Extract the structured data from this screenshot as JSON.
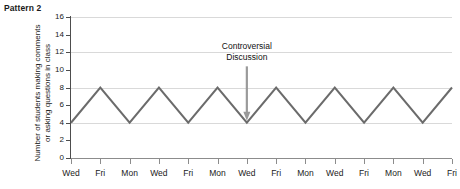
{
  "title": "Pattern 2",
  "chart_data": {
    "type": "line",
    "title": "Pattern 2",
    "xlabel": "",
    "ylabel": "Number of students making comments or asking questions in class",
    "ylabel_lines": [
      "Number of students making comments",
      "or asking questions in class"
    ],
    "categories": [
      "Wed",
      "Fri",
      "Mon",
      "Wed",
      "Fri",
      "Mon",
      "Wed",
      "Fri",
      "Mon",
      "Wed",
      "Fri",
      "Mon",
      "Wed",
      "Fri"
    ],
    "values": [
      4,
      8,
      4,
      8,
      4,
      8,
      4,
      8,
      4,
      8,
      4,
      8,
      4,
      8
    ],
    "ylim": [
      0,
      16
    ],
    "yticks": [
      0,
      2,
      4,
      6,
      8,
      10,
      12,
      14,
      16
    ],
    "ytick_labels": [
      "0",
      "2",
      "4",
      "6",
      "8",
      "10",
      "12",
      "14",
      "16"
    ],
    "gridlines_y": [
      4,
      8,
      12,
      16
    ],
    "grid": true,
    "legend": "none",
    "line_color": "#6b6b6b",
    "grid_color": "#d9d9d9",
    "axis_color": "#8c8c8c",
    "annotations": [
      {
        "text": "Controversial Discussion",
        "lines": [
          "Controversial",
          "Discussion"
        ],
        "points_to_index": 6,
        "points_to_category": "Wed",
        "points_to_value": 4,
        "arrow_color": "#9a9a9a"
      }
    ]
  }
}
